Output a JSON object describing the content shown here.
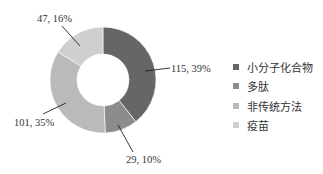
{
  "chart_data": {
    "type": "pie",
    "subtype": "donut",
    "title": "",
    "categories": [
      "小分子化合物",
      "多肽",
      "非传统方法",
      "疫苗"
    ],
    "values": [
      115,
      29,
      101,
      47
    ],
    "percentages": [
      39,
      10,
      35,
      16
    ],
    "colors": [
      "#666666",
      "#8c8c8c",
      "#bababa",
      "#cfcfcf"
    ],
    "data_labels": [
      "115, 39%",
      "29, 10%",
      "101, 35%",
      "47, 16%"
    ],
    "start_angle": "12 o'clock",
    "direction": "clockwise",
    "legend_position": "right"
  },
  "legend": {
    "items": [
      {
        "label": "小分子化合物",
        "color": "#666666"
      },
      {
        "label": "多肽",
        "color": "#8c8c8c"
      },
      {
        "label": "非传统方法",
        "color": "#bababa"
      },
      {
        "label": "疫苗",
        "color": "#cfcfcf"
      }
    ]
  },
  "labels": {
    "small_molecule": "115, 39%",
    "peptide": "29, 10%",
    "non_traditional": "101, 35%",
    "vaccine": "47, 16%"
  }
}
